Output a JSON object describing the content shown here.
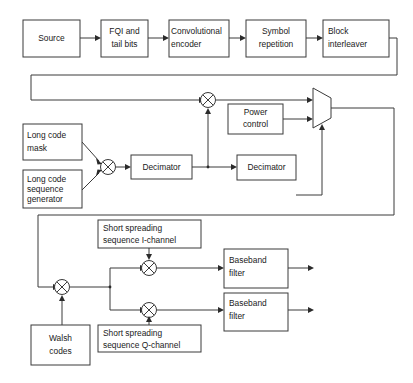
{
  "diagram": {
    "colors": {
      "stroke": "#3a3a3a",
      "background": "#ffffff",
      "text": "#1a1a1a"
    },
    "blocks": {
      "source": {
        "label": "Source"
      },
      "fqi_tail": {
        "line1": "FQI and",
        "line2": "tail bits"
      },
      "conv_encoder": {
        "line1": "Convolutional",
        "line2": "encoder"
      },
      "symbol_repetition": {
        "line1": "Symbol",
        "line2": "repetition"
      },
      "block_interleaver": {
        "line1": "Block",
        "line2": "interleaver"
      },
      "long_code_mask": {
        "line1": "Long code",
        "line2": "mask"
      },
      "long_code_sequence_generator": {
        "line1": "Long code",
        "line2": "sequence",
        "line3": "generator"
      },
      "decimator_1": {
        "label": "Decimator"
      },
      "decimator_2": {
        "label": "Decimator"
      },
      "power_control": {
        "line1": "Power",
        "line2": "control"
      },
      "short_spreading_i": {
        "line1": "Short spreading",
        "line2": "sequence I-channel"
      },
      "short_spreading_q": {
        "line1": "Short spreading",
        "line2": "sequence Q-channel"
      },
      "walsh_codes": {
        "line1": "Walsh",
        "line2": "codes"
      },
      "baseband_filter_i": {
        "line1": "Baseband",
        "line2": "filter"
      },
      "baseband_filter_q": {
        "line1": "Baseband",
        "line2": "filter"
      }
    },
    "operators": {
      "sum_long_code": {
        "symbol": "xor-adder-node"
      },
      "sum_interleaver_longcode": {
        "symbol": "xor-adder-node"
      },
      "sum_walsh": {
        "symbol": "xor-adder-node"
      },
      "sum_i_channel": {
        "symbol": "xor-adder-node"
      },
      "sum_q_channel": {
        "symbol": "xor-adder-node"
      },
      "mux": {
        "symbol": "multiplexer-trapezoid"
      }
    }
  }
}
